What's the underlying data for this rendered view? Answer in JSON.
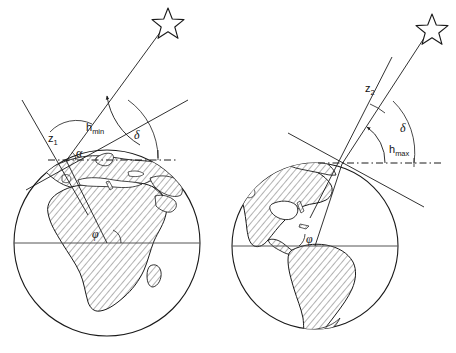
{
  "figure": {
    "background_color": "#ffffff",
    "ink_color": "#1a1a1a",
    "land_fill_color": "#e8e8e8",
    "hatch_color": "#4a4a4a"
  },
  "panels": [
    {
      "id": "left",
      "name": "lower-culmination-panel",
      "globe_label": "Africa and Europe hemisphere",
      "labels": {
        "zenith_distance": "z",
        "zenith_distance_sub": "1",
        "altitude": "h",
        "altitude_sub": "min",
        "declination": "δ",
        "latitude": "φ",
        "small_angle": "α"
      },
      "star": "star-outline"
    },
    {
      "id": "right",
      "name": "upper-culmination-panel",
      "globe_label": "Americas hemisphere",
      "labels": {
        "zenith_distance": "z",
        "zenith_distance_sub": "2",
        "altitude": "h",
        "altitude_sub": "max",
        "declination": "δ",
        "latitude": "φ"
      },
      "star": "star-outline"
    }
  ],
  "legend_terms": {
    "z1": "z1",
    "z2": "z2",
    "hmin": "hmin",
    "hmax": "hmax",
    "delta": "δ",
    "phi": "φ"
  }
}
